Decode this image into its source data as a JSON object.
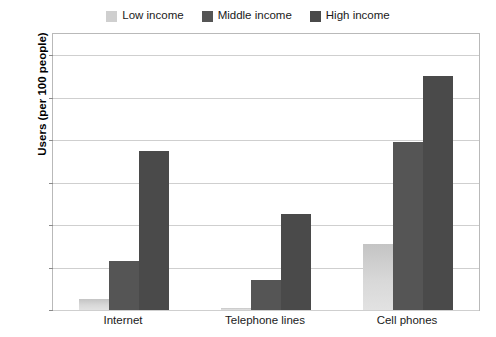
{
  "chart_data": {
    "type": "bar",
    "title": "",
    "xlabel": "",
    "ylabel": "Users (per 100 people)",
    "ylim": [
      0,
      130
    ],
    "yticks": [
      0,
      20,
      40,
      60,
      80,
      100,
      120
    ],
    "grid": true,
    "legend_position": "top-center",
    "categories": [
      "Internet",
      "Telephone lines",
      "Cell phones"
    ],
    "series": [
      {
        "name": "Low income",
        "color": "#cfcfcf",
        "values": [
          5,
          1,
          31
        ]
      },
      {
        "name": "Middle income",
        "color": "#555555",
        "values": [
          23,
          14,
          79
        ]
      },
      {
        "name": "High income",
        "color": "#4a4a4a",
        "values": [
          75,
          45,
          110
        ]
      }
    ]
  },
  "legend": {
    "entries": [
      {
        "label": "Low income"
      },
      {
        "label": "Middle income"
      },
      {
        "label": "High income"
      }
    ]
  },
  "axes": {
    "y_title": "Users (per 100 people)",
    "y_labels": [
      "120",
      "100",
      "80",
      "60",
      "40",
      "20",
      "0"
    ],
    "x_labels": [
      "Internet",
      "Telephone lines",
      "Cell phones"
    ]
  }
}
